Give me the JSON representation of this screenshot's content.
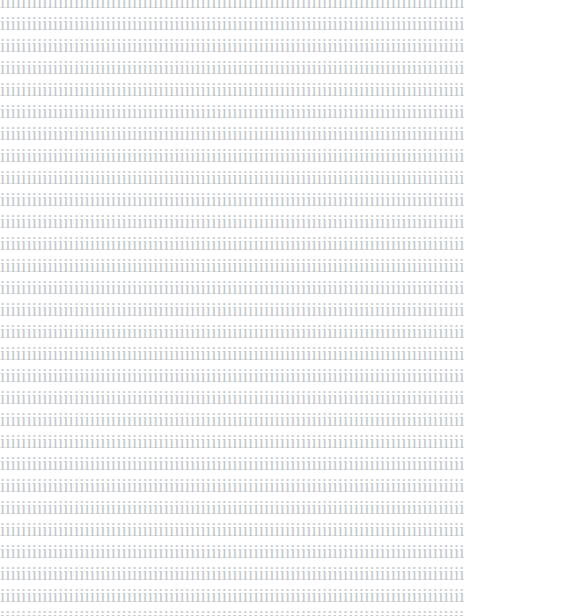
{
  "document": {
    "page_background_color": "#ffffff",
    "text_color": "#c4c8cc",
    "repeated_character": "i",
    "characters_per_line": 88,
    "line_count": 29,
    "body_text": "iiiiiiiiiiiiiiiiiiiiiiiiiiiiiiiiiiiiiiiiiiiiiiiiiiiiiiiiiiiiiiiiiiiiiiiiiiiiiiiiiiiiiiii\niiiiiiiiiiiiiiiiiiiiiiiiiiiiiiiiiiiiiiiiiiiiiiiiiiiiiiiiiiiiiiiiiiiiiiiiiiiiiiiiiiiiiiii\niiiiiiiiiiiiiiiiiiiiiiiiiiiiiiiiiiiiiiiiiiiiiiiiiiiiiiiiiiiiiiiiiiiiiiiiiiiiiiiiiiiiiiii\niiiiiiiiiiiiiiiiiiiiiiiiiiiiiiiiiiiiiiiiiiiiiiiiiiiiiiiiiiiiiiiiiiiiiiiiiiiiiiiiiiiiiiii\niiiiiiiiiiiiiiiiiiiiiiiiiiiiiiiiiiiiiiiiiiiiiiiiiiiiiiiiiiiiiiiiiiiiiiiiiiiiiiiiiiiiiiii\niiiiiiiiiiiiiiiiiiiiiiiiiiiiiiiiiiiiiiiiiiiiiiiiiiiiiiiiiiiiiiiiiiiiiiiiiiiiiiiiiiiiiiii\niiiiiiiiiiiiiiiiiiiiiiiiiiiiiiiiiiiiiiiiiiiiiiiiiiiiiiiiiiiiiiiiiiiiiiiiiiiiiiiiiiiiiiii\niiiiiiiiiiiiiiiiiiiiiiiiiiiiiiiiiiiiiiiiiiiiiiiiiiiiiiiiiiiiiiiiiiiiiiiiiiiiiiiiiiiiiiii\niiiiiiiiiiiiiiiiiiiiiiiiiiiiiiiiiiiiiiiiiiiiiiiiiiiiiiiiiiiiiiiiiiiiiiiiiiiiiiiiiiiiiiii\niiiiiiiiiiiiiiiiiiiiiiiiiiiiiiiiiiiiiiiiiiiiiiiiiiiiiiiiiiiiiiiiiiiiiiiiiiiiiiiiiiiiiiii\niiiiiiiiiiiiiiiiiiiiiiiiiiiiiiiiiiiiiiiiiiiiiiiiiiiiiiiiiiiiiiiiiiiiiiiiiiiiiiiiiiiiiiii\niiiiiiiiiiiiiiiiiiiiiiiiiiiiiiiiiiiiiiiiiiiiiiiiiiiiiiiiiiiiiiiiiiiiiiiiiiiiiiiiiiiiiiii\niiiiiiiiiiiiiiiiiiiiiiiiiiiiiiiiiiiiiiiiiiiiiiiiiiiiiiiiiiiiiiiiiiiiiiiiiiiiiiiiiiiiiiii\niiiiiiiiiiiiiiiiiiiiiiiiiiiiiiiiiiiiiiiiiiiiiiiiiiiiiiiiiiiiiiiiiiiiiiiiiiiiiiiiiiiiiiii\niiiiiiiiiiiiiiiiiiiiiiiiiiiiiiiiiiiiiiiiiiiiiiiiiiiiiiiiiiiiiiiiiiiiiiiiiiiiiiiiiiiiiiii\niiiiiiiiiiiiiiiiiiiiiiiiiiiiiiiiiiiiiiiiiiiiiiiiiiiiiiiiiiiiiiiiiiiiiiiiiiiiiiiiiiiiiiii\niiiiiiiiiiiiiiiiiiiiiiiiiiiiiiiiiiiiiiiiiiiiiiiiiiiiiiiiiiiiiiiiiiiiiiiiiiiiiiiiiiiiiiii\niiiiiiiiiiiiiiiiiiiiiiiiiiiiiiiiiiiiiiiiiiiiiiiiiiiiiiiiiiiiiiiiiiiiiiiiiiiiiiiiiiiiiiii\niiiiiiiiiiiiiiiiiiiiiiiiiiiiiiiiiiiiiiiiiiiiiiiiiiiiiiiiiiiiiiiiiiiiiiiiiiiiiiiiiiiiiiii\niiiiiiiiiiiiiiiiiiiiiiiiiiiiiiiiiiiiiiiiiiiiiiiiiiiiiiiiiiiiiiiiiiiiiiiiiiiiiiiiiiiiiiii\niiiiiiiiiiiiiiiiiiiiiiiiiiiiiiiiiiiiiiiiiiiiiiiiiiiiiiiiiiiiiiiiiiiiiiiiiiiiiiiiiiiiiiii\niiiiiiiiiiiiiiiiiiiiiiiiiiiiiiiiiiiiiiiiiiiiiiiiiiiiiiiiiiiiiiiiiiiiiiiiiiiiiiiiiiiiiiii\niiiiiiiiiiiiiiiiiiiiiiiiiiiiiiiiiiiiiiiiiiiiiiiiiiiiiiiiiiiiiiiiiiiiiiiiiiiiiiiiiiiiiiii\niiiiiiiiiiiiiiiiiiiiiiiiiiiiiiiiiiiiiiiiiiiiiiiiiiiiiiiiiiiiiiiiiiiiiiiiiiiiiiiiiiiiiiii\niiiiiiiiiiiiiiiiiiiiiiiiiiiiiiiiiiiiiiiiiiiiiiiiiiiiiiiiiiiiiiiiiiiiiiiiiiiiiiiiiiiiiiii\niiiiiiiiiiiiiiiiiiiiiiiiiiiiiiiiiiiiiiiiiiiiiiiiiiiiiiiiiiiiiiiiiiiiiiiiiiiiiiiiiiiiiiii\niiiiiiiiiiiiiiiiiiiiiiiiiiiiiiiiiiiiiiiiiiiiiiiiiiiiiiiiiiiiiiiiiiiiiiiiiiiiiiiiiiiiiiii\niiiiiiiiiiiiiiiiiiiiiiiiiiiiiiiiiiiiiiiiiiiiiiiiiiiiiiiiiiiiiiiiiiiiiiiiiiiiiiiiiiiiiiii\niiiiiiiiiiiiiiiiiiiiiiiiiiiiiiiiiiiiiiiiiiiiiiiiiiiiiiiiiiiiiiiiiiiiiiiiiiiiiiiiiiiiiiii"
  }
}
